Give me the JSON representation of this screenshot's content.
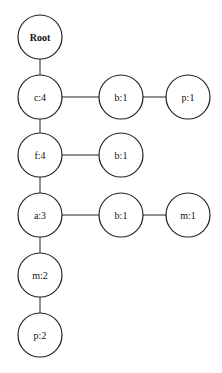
{
  "diagram": {
    "type": "fp-tree",
    "nodes": [
      {
        "id": "root",
        "label": "Root",
        "x": 40,
        "y": 37
      },
      {
        "id": "c4",
        "label": "c:4",
        "x": 40,
        "y": 97
      },
      {
        "id": "b1a",
        "label": "b:1",
        "x": 121,
        "y": 97
      },
      {
        "id": "p1",
        "label": "p:1",
        "x": 188,
        "y": 97
      },
      {
        "id": "f4",
        "label": "f:4",
        "x": 40,
        "y": 155
      },
      {
        "id": "b1b",
        "label": "b:1",
        "x": 121,
        "y": 155
      },
      {
        "id": "a3",
        "label": "a:3",
        "x": 40,
        "y": 215
      },
      {
        "id": "b1c",
        "label": "b:1",
        "x": 121,
        "y": 215
      },
      {
        "id": "m1",
        "label": "m:1",
        "x": 188,
        "y": 215
      },
      {
        "id": "m2",
        "label": "m:2",
        "x": 40,
        "y": 275
      },
      {
        "id": "p2",
        "label": "p:2",
        "x": 40,
        "y": 335
      }
    ],
    "edges": [
      [
        "root",
        "c4"
      ],
      [
        "c4",
        "b1a"
      ],
      [
        "b1a",
        "p1"
      ],
      [
        "c4",
        "f4"
      ],
      [
        "f4",
        "b1b"
      ],
      [
        "f4",
        "a3"
      ],
      [
        "a3",
        "b1c"
      ],
      [
        "b1c",
        "m1"
      ],
      [
        "a3",
        "m2"
      ],
      [
        "m2",
        "p2"
      ]
    ],
    "node_radius": 22
  }
}
